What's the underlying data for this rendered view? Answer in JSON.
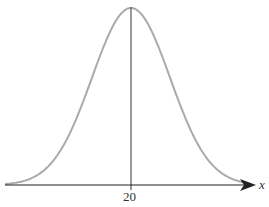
{
  "chart_data": {
    "type": "line",
    "title": "",
    "xlabel": "x",
    "ylabel": "",
    "x_ticks": [
      "20"
    ],
    "mean": 20,
    "distribution": "normal",
    "grid": false,
    "legend": null,
    "annotations": [
      "vertical line at mean x = 20"
    ]
  },
  "colors": {
    "curve": "#aaaaaa",
    "axis": "#222222",
    "mean_line": "#555555"
  },
  "labels": {
    "tick_mean": "20",
    "axis_var": "x"
  }
}
